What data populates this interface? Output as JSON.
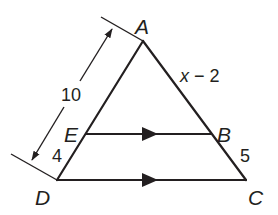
{
  "figure": {
    "type": "triangle with parallel segment (triangle proportionality)",
    "stroke_color": "#231f20",
    "background": "#ffffff",
    "points": {
      "A": {
        "label": "A"
      },
      "B": {
        "label": "B"
      },
      "C": {
        "label": "C"
      },
      "D": {
        "label": "D"
      },
      "E": {
        "label": "E"
      }
    },
    "segments": [
      {
        "from": "A",
        "to": "D",
        "note": "left side, E lies on it"
      },
      {
        "from": "A",
        "to": "C",
        "note": "right side, B lies on it"
      },
      {
        "from": "D",
        "to": "C",
        "note": "base, marked parallel"
      },
      {
        "from": "E",
        "to": "B",
        "note": "marked parallel to DC"
      }
    ],
    "parallel_marks": [
      "EB",
      "DC"
    ],
    "measurements": {
      "AD": {
        "label": "10",
        "note": "dimension line with arrows from A to D"
      },
      "ED": {
        "label": "4"
      },
      "AB": {
        "label_var": "x",
        "label_rest": " − 2"
      },
      "BC": {
        "label": "5"
      }
    }
  }
}
